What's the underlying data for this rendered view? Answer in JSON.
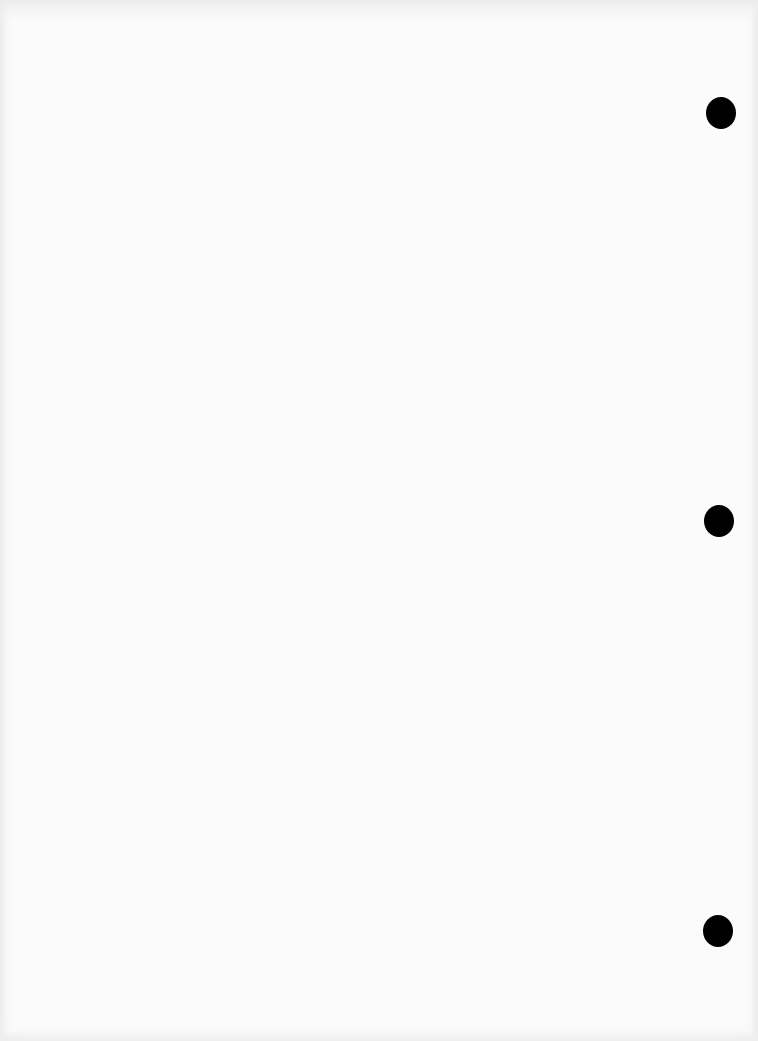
{
  "document": {
    "type": "blank scanned page",
    "background_color": "#fbfbfb",
    "bleed_through_text": "",
    "punch_holes": [
      {
        "cx": 721,
        "cy": 113
      },
      {
        "cx": 719,
        "cy": 521
      },
      {
        "cx": 718,
        "cy": 931
      }
    ],
    "punch_hole_color": "#000000"
  }
}
